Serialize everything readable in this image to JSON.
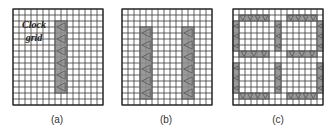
{
  "figure": {
    "grid": {
      "cols": 15,
      "rows": 16,
      "cell": 6,
      "line_color": "#3a3a3a",
      "block_color": "#9a9a9a",
      "block_border": "#555555",
      "triangle_color": "#555555"
    },
    "panels": [
      {
        "id": "a",
        "caption": "(a)",
        "x": 12,
        "y": 8,
        "annotation": {
          "line1": "Clock",
          "line2": "grid"
        },
        "blocks": [
          {
            "col": 7,
            "row": 2,
            "w": 2,
            "h": 12,
            "tri": "left",
            "tri_count": 6,
            "orient": "v"
          }
        ]
      },
      {
        "id": "b",
        "caption": "(b)",
        "x": 121,
        "y": 8,
        "blocks": [
          {
            "col": 3,
            "row": 3,
            "w": 2,
            "h": 12,
            "tri": "left",
            "tri_count": 6,
            "orient": "v"
          },
          {
            "col": 10,
            "row": 3,
            "w": 2,
            "h": 12,
            "tri": "left",
            "tri_count": 6,
            "orient": "v"
          }
        ]
      },
      {
        "id": "c",
        "caption": "(c)",
        "x": 232,
        "y": 8,
        "blocks": [
          {
            "col": 1,
            "row": 1,
            "w": 5,
            "h": 1,
            "tri": "down",
            "tri_count": 4,
            "orient": "h"
          },
          {
            "col": 9,
            "row": 1,
            "w": 5,
            "h": 1,
            "tri": "down",
            "tri_count": 4,
            "orient": "h"
          },
          {
            "col": 0,
            "row": 2,
            "w": 1,
            "h": 5,
            "tri": "left",
            "tri_count": 3,
            "orient": "v"
          },
          {
            "col": 14,
            "row": 2,
            "w": 1,
            "h": 5,
            "tri": "left",
            "tri_count": 3,
            "orient": "v"
          },
          {
            "col": 7,
            "row": 2,
            "w": 1,
            "h": 5,
            "tri": "left",
            "tri_count": 3,
            "orient": "v"
          },
          {
            "col": 1,
            "row": 7,
            "w": 5,
            "h": 1,
            "tri": "down",
            "tri_count": 3,
            "orient": "h"
          },
          {
            "col": 9,
            "row": 7,
            "w": 5,
            "h": 1,
            "tri": "down",
            "tri_count": 3,
            "orient": "h"
          },
          {
            "col": 0,
            "row": 9,
            "w": 1,
            "h": 5,
            "tri": "left",
            "tri_count": 3,
            "orient": "v"
          },
          {
            "col": 14,
            "row": 9,
            "w": 1,
            "h": 5,
            "tri": "left",
            "tri_count": 3,
            "orient": "v"
          },
          {
            "col": 7,
            "row": 9,
            "w": 1,
            "h": 5,
            "tri": "left",
            "tri_count": 3,
            "orient": "v"
          },
          {
            "col": 1,
            "row": 14,
            "w": 5,
            "h": 1,
            "tri": "down",
            "tri_count": 4,
            "orient": "h"
          },
          {
            "col": 9,
            "row": 14,
            "w": 5,
            "h": 1,
            "tri": "down",
            "tri_count": 4,
            "orient": "h"
          }
        ]
      }
    ]
  }
}
